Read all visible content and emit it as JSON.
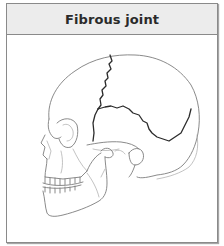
{
  "card": {
    "title": "Fibrous joint"
  },
  "figure": {
    "highlighted_feature": "cranial-sutures",
    "colors": {
      "header_background": "#ececec",
      "border": "#8a8a8a",
      "bone_outline": "#7d7d7d",
      "suture_line": "#2c2c2c"
    }
  }
}
